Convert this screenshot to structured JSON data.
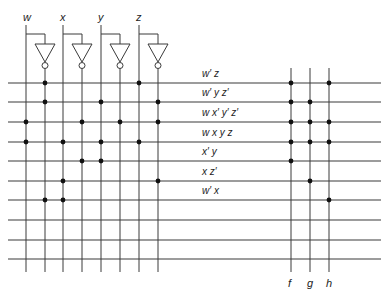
{
  "diagram": {
    "type": "PLA (programmable logic array)",
    "inputs": [
      {
        "name": "w",
        "x": 26,
        "inv_x": 45
      },
      {
        "name": "x",
        "x": 63,
        "inv_x": 82
      },
      {
        "name": "y",
        "x": 101,
        "inv_x": 120
      },
      {
        "name": "z",
        "x": 139,
        "inv_x": 158
      }
    ],
    "product_rows_y": [
      83,
      102,
      122,
      142,
      161,
      181,
      200,
      220,
      240,
      259
    ],
    "product_terms": [
      {
        "label": "w′ z",
        "and_taps": [
          "w'",
          "z"
        ]
      },
      {
        "label": "w′ y z′",
        "and_taps": [
          "w'",
          "y",
          "z'"
        ]
      },
      {
        "label": "w x′ y′ z′",
        "and_taps": [
          "w",
          "x'",
          "y'",
          "z'"
        ]
      },
      {
        "label": "w x y z",
        "and_taps": [
          "w",
          "x",
          "y",
          "z"
        ]
      },
      {
        "label": "x′ y",
        "and_taps": [
          "x'",
          "y"
        ]
      },
      {
        "label": "x z′",
        "and_taps": [
          "x",
          "z'"
        ]
      },
      {
        "label": "w′ x",
        "and_taps": [
          "w'",
          "x"
        ]
      },
      {
        "label": "",
        "and_taps": []
      },
      {
        "label": "",
        "and_taps": []
      },
      {
        "label": "",
        "and_taps": []
      }
    ],
    "outputs": [
      {
        "name": "f",
        "x": 291,
        "or_rows": [
          0,
          1,
          2,
          3,
          4
        ]
      },
      {
        "name": "g",
        "x": 310,
        "or_rows": [
          1,
          2,
          3,
          5
        ]
      },
      {
        "name": "h",
        "x": 329,
        "or_rows": [
          0,
          2,
          3,
          6
        ]
      }
    ],
    "line_color": "#3a3a3a",
    "dot_color": "#111111"
  }
}
